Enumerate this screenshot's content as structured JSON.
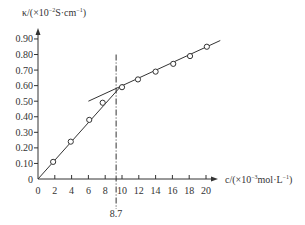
{
  "chart_data": {
    "type": "line",
    "title": "",
    "xlabel": "c/(×10⁻³mol·L⁻¹)",
    "ylabel": "κ/(×10⁻²S·cm⁻¹)",
    "xlabel_parts": {
      "pre": "c/(×10",
      "exp": "−3",
      "post": "mol·L",
      "exp2": "−1",
      "end": ")"
    },
    "ylabel_parts": {
      "pre": "κ/(×10",
      "exp": "−2",
      "post": "S·cm",
      "exp2": "−1",
      "end": ")"
    },
    "xlim": [
      0,
      21.5
    ],
    "ylim": [
      0,
      1.0
    ],
    "x_ticks": [
      0,
      2,
      4,
      6,
      8,
      10,
      12,
      14,
      16,
      18,
      20
    ],
    "x_tick_labels": [
      "0",
      "2",
      "4",
      "6",
      "8",
      "10",
      "12",
      "14",
      "16",
      "18",
      "20"
    ],
    "y_ticks": [
      0,
      0.1,
      0.2,
      0.3,
      0.4,
      0.5,
      0.6,
      0.7,
      0.8,
      0.9
    ],
    "y_tick_labels": [
      "0",
      "0.10",
      "0.20",
      "0.30",
      "0.40",
      "0.50",
      "0.60",
      "0.70",
      "0.80",
      "0.90"
    ],
    "grid": false,
    "legend": null,
    "series": [
      {
        "name": "conductivity data",
        "marker": "open-circle",
        "x": [
          1.8,
          3.9,
          6.1,
          7.7,
          10.0,
          11.9,
          14.0,
          16.1,
          18.1,
          20.1
        ],
        "y": [
          0.11,
          0.24,
          0.38,
          0.49,
          0.59,
          0.64,
          0.69,
          0.74,
          0.79,
          0.85
        ]
      },
      {
        "name": "fit line below CMC",
        "marker": "none",
        "x": [
          0,
          10.1
        ],
        "y": [
          0,
          0.61
        ]
      },
      {
        "name": "fit line above CMC",
        "marker": "none",
        "x": [
          6.0,
          21.7
        ],
        "y": [
          0.5,
          0.89
        ]
      }
    ],
    "annotations": [
      {
        "type": "vertical-dash-dot-line",
        "x_pixel_value": 9.3,
        "label": "8.7",
        "y_top": 0.8
      }
    ]
  },
  "layout": {
    "origin_px": [
      38,
      179
    ],
    "px_per_x": 8.4,
    "px_per_y": 155.6,
    "x_axis_end_px": 218,
    "y_axis_top_px": 28,
    "line_color": "#333333"
  }
}
